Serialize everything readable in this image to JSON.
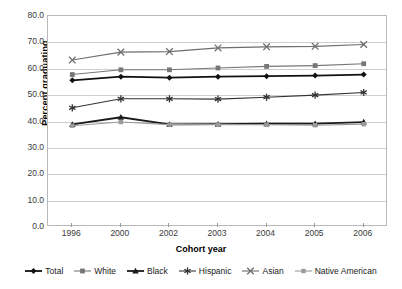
{
  "axes": {
    "ylabel": "Percent graduating",
    "xlabel": "Cohort year",
    "yticks": [
      "80.0",
      "70.0",
      "60.0",
      "50.0",
      "40.0",
      "30.0",
      "20.0",
      "10.0",
      "0.0"
    ],
    "xticks": [
      "1996",
      "2000",
      "2002",
      "2003",
      "2004",
      "2005",
      "2006"
    ]
  },
  "legend": {
    "items": [
      {
        "label": "Total",
        "marker": "diamond",
        "color": "#111111"
      },
      {
        "label": "White",
        "marker": "square",
        "color": "#777777"
      },
      {
        "label": "Black",
        "marker": "triangle",
        "color": "#1a1a1a"
      },
      {
        "label": "Hispanic",
        "marker": "star",
        "color": "#333333"
      },
      {
        "label": "Asian",
        "marker": "cross",
        "color": "#6e6e6e"
      },
      {
        "label": "Native American",
        "marker": "square-small",
        "color": "#9a9a9a"
      }
    ]
  },
  "chart_data": {
    "type": "line",
    "title": "",
    "xlabel": "Cohort year",
    "ylabel": "Percent graduating",
    "categories": [
      "1996",
      "2000",
      "2002",
      "2003",
      "2004",
      "2005",
      "2006"
    ],
    "ylim": [
      0.0,
      80.0
    ],
    "ytick_step": 10.0,
    "grid": true,
    "legend_position": "bottom",
    "series": [
      {
        "name": "Total",
        "color": "#111111",
        "marker": "diamond",
        "values": [
          55.6,
          57.0,
          56.6,
          57.0,
          57.2,
          57.4,
          57.8
        ]
      },
      {
        "name": "White",
        "color": "#777777",
        "marker": "square",
        "values": [
          57.8,
          59.6,
          59.6,
          60.3,
          60.9,
          61.2,
          61.9
        ]
      },
      {
        "name": "Black",
        "color": "#1a1a1a",
        "marker": "triangle",
        "values": [
          38.9,
          41.6,
          38.9,
          39.0,
          39.2,
          39.2,
          39.8
        ]
      },
      {
        "name": "Hispanic",
        "color": "#333333",
        "marker": "star",
        "values": [
          45.2,
          48.6,
          48.6,
          48.5,
          49.2,
          50.0,
          51.0
        ]
      },
      {
        "name": "Asian",
        "color": "#6e6e6e",
        "marker": "cross",
        "values": [
          63.3,
          66.3,
          66.5,
          67.9,
          68.3,
          68.5,
          69.2
        ]
      },
      {
        "name": "Native American",
        "color": "#9a9a9a",
        "marker": "square-small",
        "values": [
          38.4,
          39.8,
          38.8,
          38.8,
          38.8,
          38.6,
          39.0
        ]
      }
    ]
  }
}
